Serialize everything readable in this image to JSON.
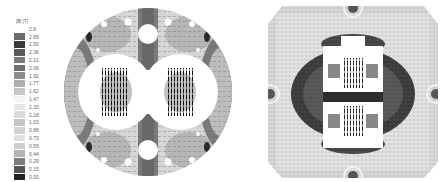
{
  "chart_data": [
    {
      "type": "heatmap",
      "title": "",
      "description": "Magnetic flux density magnitude |B| with field vectors, circular cross-section (two coils side by side)",
      "colorbar": {
        "title": "|B| (T)",
        "ticks": [
          "2.8",
          "2.65",
          "2.50",
          "2.36",
          "2.21",
          "2.06",
          "1.92",
          "1.77",
          "1.62",
          "1.47",
          "1.33",
          "1.18",
          "1.03",
          "0.88",
          "0.73",
          "0.59",
          "0.44",
          "0.29",
          "0.15",
          "0.00"
        ],
        "colors": [
          "#ffffff",
          "#6a6a6a",
          "#3a3a3a",
          "#5a5a5a",
          "#7a7a7a",
          "#6e6e6e",
          "#8c8c8c",
          "#b0b0b0",
          "#c6c6c6",
          "#f4f4f4",
          "#e8e8e8",
          "#dcdcdc",
          "#c4c4c4",
          "#d2d2d2",
          "#e0e0e0",
          "#cfcfcf",
          "#b4b4b4",
          "#7c7c7c",
          "#555555",
          "#222222"
        ]
      },
      "grid": false,
      "legend_position": "left"
    },
    {
      "type": "heatmap",
      "title": "",
      "description": "Magnetic flux density magnitude |B| with field vectors, square (octagonal-corner) cross-section (two coils stacked vertically)",
      "colorbar": "shared",
      "grid": false
    }
  ],
  "legend": {
    "title": "|B| (T)",
    "items": [
      {
        "label": "2.8",
        "color": "#ffffff"
      },
      {
        "label": "2.65",
        "color": "#6a6a6a"
      },
      {
        "label": "2.50",
        "color": "#3a3a3a"
      },
      {
        "label": "2.36",
        "color": "#5a5a5a"
      },
      {
        "label": "2.21",
        "color": "#7a7a7a"
      },
      {
        "label": "2.06",
        "color": "#6e6e6e"
      },
      {
        "label": "1.92",
        "color": "#8c8c8c"
      },
      {
        "label": "1.77",
        "color": "#b0b0b0"
      },
      {
        "label": "1.62",
        "color": "#c6c6c6"
      },
      {
        "label": "1.47",
        "color": "#f4f4f4"
      },
      {
        "label": "1.33",
        "color": "#e8e8e8"
      },
      {
        "label": "1.18",
        "color": "#dcdcdc"
      },
      {
        "label": "1.03",
        "color": "#c4c4c4"
      },
      {
        "label": "0.88",
        "color": "#d2d2d2"
      },
      {
        "label": "0.73",
        "color": "#e0e0e0"
      },
      {
        "label": "0.59",
        "color": "#cfcfcf"
      },
      {
        "label": "0.44",
        "color": "#b4b4b4"
      },
      {
        "label": "0.29",
        "color": "#7c7c7c"
      },
      {
        "label": "0.15",
        "color": "#555555"
      },
      {
        "label": "0.00",
        "color": "#222222"
      }
    ]
  }
}
